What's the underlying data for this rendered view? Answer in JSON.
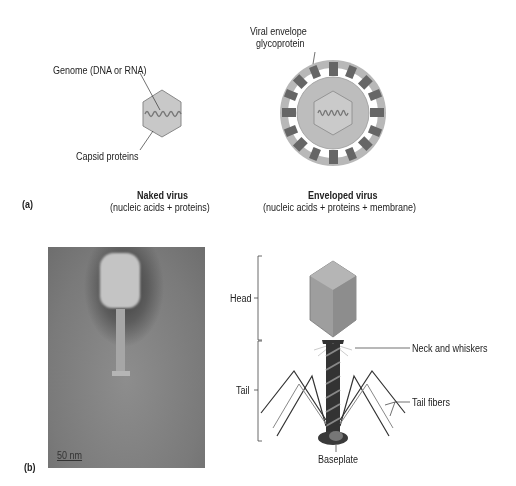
{
  "panel_a": {
    "label": "(a)",
    "naked_virus": {
      "title": "Naked virus",
      "subtitle": "(nucleic acids + proteins)",
      "callouts": [
        "Genome (DNA or RNA)",
        "Capsid proteins"
      ]
    },
    "enveloped_virus": {
      "title": "Enveloped virus",
      "subtitle": "(nucleic acids + proteins + membrane)",
      "callouts": [
        "Viral envelope",
        "glycoprotein"
      ]
    }
  },
  "panel_b": {
    "label": "(b)",
    "micrograph": {
      "scale_bar": "50 nm"
    },
    "bacteriophage": {
      "brackets": [
        "Head",
        "Tail"
      ],
      "callouts": [
        "Neck and whiskers",
        "Tail fibers",
        "Baseplate"
      ]
    }
  },
  "colors": {
    "capsid_fill": "#c8c8c8",
    "envelope_fill": "#b4b4b4",
    "glycoprotein_dark": "#666666",
    "genome_line": "#777777",
    "phage_head": "#9a9a9a",
    "tail_dark": "#333333"
  }
}
